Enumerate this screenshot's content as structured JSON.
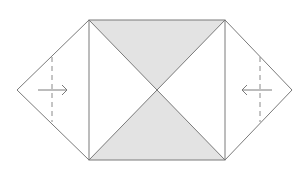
{
  "diagram": {
    "colors": {
      "line": "#7a7a7a",
      "shaded": "#e3e3e3",
      "paper": "#ffffff",
      "dash": "#8a8a8a"
    },
    "square": {
      "x1": 89,
      "y1": 20,
      "x2": 225,
      "y2": 160
    },
    "center": {
      "x": 157,
      "y": 90
    },
    "left_flap": {
      "tip": {
        "x": 17,
        "y": 90
      }
    },
    "right_flap": {
      "tip": {
        "x": 292,
        "y": 90
      }
    },
    "left_fold_line": {
      "x": 52,
      "y1": 57,
      "y2": 122
    },
    "right_fold_line": {
      "x": 260,
      "y1": 57,
      "y2": 122
    },
    "left_arrow": {
      "from_x": 38,
      "to_x": 67,
      "y": 90,
      "direction": "right"
    },
    "right_arrow": {
      "from_x": 272,
      "to_x": 242,
      "y": 90,
      "direction": "left"
    }
  }
}
